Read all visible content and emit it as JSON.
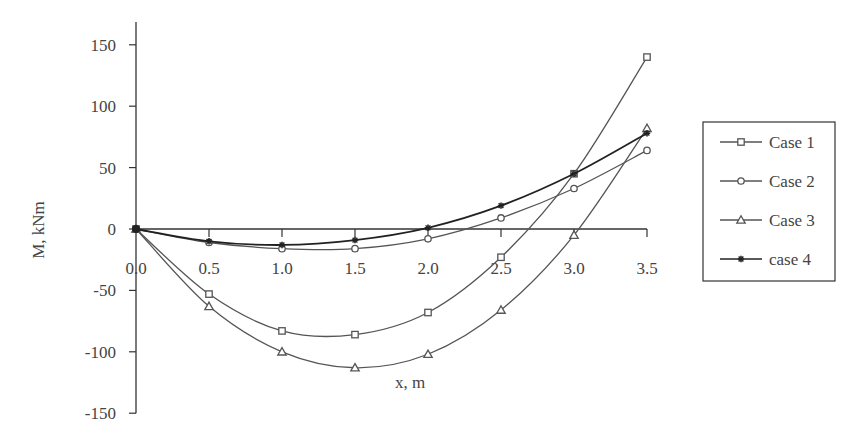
{
  "chart_data": {
    "type": "line",
    "title": "",
    "xlabel": "x, m",
    "ylabel": "M, kNm",
    "xlim": [
      0,
      3.5
    ],
    "ylim": [
      -150,
      150
    ],
    "x_ticks": [
      "0.0",
      "0.5",
      "1.0",
      "1.5",
      "2.0",
      "2.5",
      "3.0",
      "3.5"
    ],
    "y_ticks": [
      "150",
      "100",
      "50",
      "0",
      "-50",
      "-100",
      "-150"
    ],
    "grid": false,
    "legend_position": "right",
    "x": [
      0,
      0.5,
      1.0,
      1.5,
      2.0,
      2.5,
      3.0,
      3.5
    ],
    "series": [
      {
        "name": "Case 1",
        "marker": "square",
        "values": [
          0,
          -53,
          -83,
          -86,
          -68,
          -23,
          45,
          140
        ]
      },
      {
        "name": "Case 2",
        "marker": "circle",
        "values": [
          0,
          -11,
          -16,
          -16,
          -8,
          9,
          33,
          64
        ]
      },
      {
        "name": "Case 3",
        "marker": "triangle",
        "values": [
          0,
          -63,
          -100,
          -113,
          -102,
          -66,
          -5,
          82
        ]
      },
      {
        "name": "case 4",
        "marker": "star",
        "values": [
          0,
          -10,
          -13,
          -9,
          1,
          19,
          45,
          78
        ]
      }
    ]
  },
  "legend": {
    "items": [
      "Case 1",
      "Case 2",
      "Case 3",
      "case 4"
    ]
  },
  "colors": {
    "line": "#555555",
    "axis": "#333333",
    "text": "#444444"
  }
}
